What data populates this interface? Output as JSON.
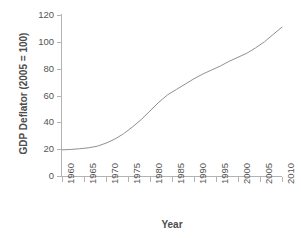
{
  "chart_data": {
    "type": "line",
    "title": "",
    "xlabel": "Year",
    "ylabel": "GDP Deflator (2005 = 100)",
    "xlim": [
      1960,
      2010
    ],
    "ylim": [
      0,
      120
    ],
    "grid": false,
    "legend": null,
    "line_color": "#909090",
    "axis_color": "#b3b3b3",
    "text_color": "#555555",
    "x_ticks": [
      1960,
      1965,
      1970,
      1975,
      1980,
      1985,
      1990,
      1995,
      2000,
      2005,
      2010
    ],
    "x_tick_labels": [
      "1960",
      "1965",
      "1970",
      "1975",
      "1980",
      "1985",
      "1990",
      "1995",
      "2000",
      "2005",
      "2010"
    ],
    "y_ticks": [
      0,
      20,
      40,
      60,
      80,
      100,
      120
    ],
    "y_tick_labels": [
      "0",
      "20",
      "40",
      "60",
      "80",
      "100",
      "120"
    ],
    "series": [
      {
        "name": "GDP Deflator",
        "x": [
          1960,
          1962,
          1964,
          1966,
          1968,
          1970,
          1972,
          1974,
          1976,
          1978,
          1980,
          1982,
          1984,
          1986,
          1988,
          1990,
          1992,
          1994,
          1996,
          1998,
          2000,
          2002,
          2004,
          2006,
          2008,
          2010
        ],
        "values": [
          19.5,
          19.8,
          20.3,
          21.0,
          22.2,
          24.5,
          27.5,
          31.5,
          36.5,
          42.0,
          48.5,
          55.0,
          60.5,
          64.5,
          68.5,
          72.5,
          76.0,
          79.0,
          82.0,
          85.5,
          88.5,
          91.5,
          95.5,
          100.0,
          105.5,
          111.0
        ]
      }
    ]
  }
}
